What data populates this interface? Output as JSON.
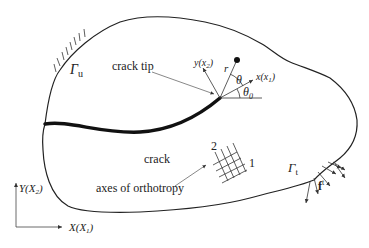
{
  "diagram": {
    "type": "cracked orthotropic body",
    "labels": {
      "gamma_u": "Γ",
      "gamma_u_sub": "u",
      "crack_tip": "crack tip",
      "crack": "crack",
      "axes_of_orthotropy": "axes of orthotropy",
      "ortho_axis_1": "1",
      "ortho_axis_2": "2",
      "gamma_t": "Γ",
      "gamma_t_sub": "t",
      "traction": "f",
      "traction_sup": "t",
      "local_y": "y(x",
      "local_y_sub": "2",
      "local_x": "x(x",
      "local_x_sub": "1",
      "close_paren": ")",
      "r": "r",
      "theta": "θ",
      "theta0": "θ",
      "theta0_sub": "0",
      "global_Y": "Y(X",
      "global_Y_sub": "2",
      "global_X": "X(X",
      "global_X_sub": "1"
    },
    "colors": {
      "line": "#222222",
      "arrow": "#555555",
      "background": "#ffffff"
    }
  }
}
